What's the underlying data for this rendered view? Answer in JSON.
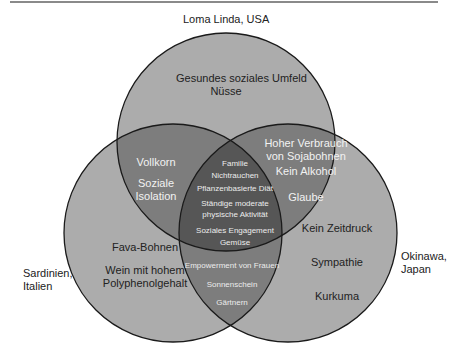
{
  "diagram": {
    "type": "venn",
    "colors": {
      "single": "#acacac",
      "double": "#7d7d7d",
      "triple": "#565656",
      "stroke": "#1a1a1a",
      "rule": "#8a8a8a"
    },
    "sets": [
      {
        "id": "top",
        "label": "Loma Linda, USA",
        "cx": 226,
        "cy": 142,
        "r": 109
      },
      {
        "id": "left",
        "label_lines": [
          "Sardinien,",
          "Italien"
        ],
        "cx": 173,
        "cy": 233,
        "r": 109
      },
      {
        "id": "right",
        "label_lines": [
          "Okinawa,",
          "Japan"
        ],
        "cx": 288,
        "cy": 233,
        "r": 109
      }
    ],
    "regions": {
      "top_only": [
        "Gesundes soziales Umfeld",
        "Nüsse"
      ],
      "left_only": [
        "Fava-Bohnen",
        "Wein mit hohem",
        "Polyphenolgehalt"
      ],
      "right_only": [
        "Kein Zeitdruck",
        "Sympathie",
        "Kurkuma"
      ],
      "top_left": [
        "Vollkorn",
        "Soziale",
        "Isolation"
      ],
      "top_right": [
        "Hoher Verbrauch",
        "von Sojabohnen",
        "Kein Alkohol",
        "Glaube"
      ],
      "left_right": [
        "Empowerment von Frauen",
        "Sonnenschein",
        "Gärtnern"
      ],
      "all_three": [
        "Familie",
        "Nichtrauchen",
        "Pflanzenbasierte Diät",
        "Ständige moderate",
        "physische Aktivität",
        "Soziales Engagement",
        "Gemüse"
      ]
    }
  }
}
